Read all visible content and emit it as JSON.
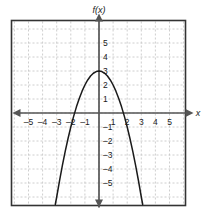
{
  "chart_data": {
    "type": "line",
    "title": "",
    "subtitle": "",
    "xlabel": "x",
    "ylabel": "f(x)",
    "function": "f(x) = -x^2 + 3",
    "xlim": [
      -6.2,
      6.2
    ],
    "ylim": [
      -6.6,
      6.0
    ],
    "grid": true,
    "grid_style": "dashed",
    "legend": "none",
    "x_ticks": [
      -5,
      -4,
      -3,
      -2,
      -1,
      1,
      2,
      3,
      4,
      5
    ],
    "x_tick_labels": [
      "–5",
      "–4",
      "–3",
      "–2",
      "–1",
      "1",
      "2",
      "3",
      "4",
      "5"
    ],
    "y_ticks": [
      5,
      4,
      3,
      2,
      1,
      -1,
      -2,
      -3,
      -4,
      -5
    ],
    "y_tick_labels": [
      "5",
      "4",
      "3",
      "2",
      "1",
      "–1",
      "–2",
      "–3",
      "–4",
      "–5"
    ],
    "vertex": [
      0,
      3
    ],
    "roots": [
      -1.73,
      1.73
    ],
    "y_intercept": 3,
    "opens": "down",
    "series": [
      {
        "name": "f(x)",
        "x": [
          -3.1,
          -3.0,
          -2.8,
          -2.6,
          -2.4,
          -2.2,
          -2.0,
          -1.8,
          -1.6,
          -1.4,
          -1.2,
          -1.0,
          -0.8,
          -0.6,
          -0.4,
          -0.2,
          0.0,
          0.2,
          0.4,
          0.6,
          0.8,
          1.0,
          1.2,
          1.4,
          1.6,
          1.8,
          2.0,
          2.2,
          2.4,
          2.6,
          2.8,
          3.0,
          3.1
        ],
        "values": [
          -6.61,
          -6.0,
          -4.84,
          -3.76,
          -2.76,
          -1.84,
          -1.0,
          -0.24,
          0.44,
          1.04,
          1.56,
          2.0,
          2.36,
          2.64,
          2.84,
          2.96,
          3.0,
          2.96,
          2.84,
          2.64,
          2.36,
          2.0,
          1.56,
          1.04,
          0.44,
          -0.24,
          -1.0,
          -1.84,
          -2.76,
          -3.76,
          -4.84,
          -6.0,
          -6.61
        ]
      }
    ]
  },
  "labels": {
    "y_axis_name": "f(x)",
    "x_axis_name": "x"
  },
  "colors": {
    "frame": "#333333",
    "grid": "#c8c8c8",
    "axis": "#555555",
    "curve": "#1a1a1a",
    "text": "#1a1a1a",
    "background": "#ffffff"
  }
}
